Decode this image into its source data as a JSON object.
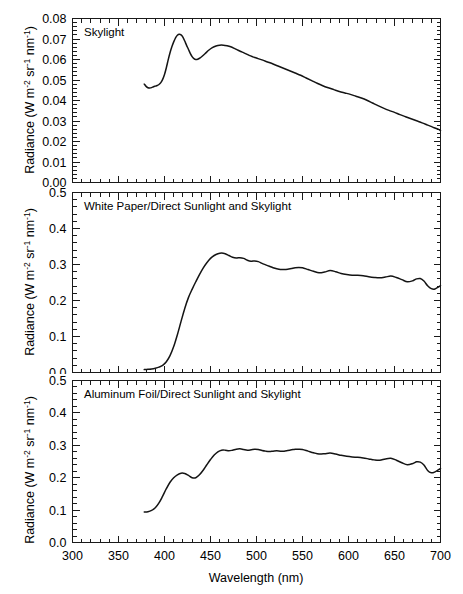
{
  "figure": {
    "background": "#ffffff",
    "line_color": "#141414",
    "axis_color": "#1a1a1a"
  },
  "axis": {
    "xlabel": "Wavelength (nm)",
    "ylabel_main": "Radiance (W m",
    "ylabel_sup1": "-2",
    "ylabel_mid1": " sr",
    "ylabel_sup2": "-1",
    "ylabel_mid2": " nm",
    "ylabel_sup3": "-1",
    "ylabel_end": ")",
    "xticklabels": [
      "300",
      "350",
      "400",
      "450",
      "500",
      "550",
      "600",
      "650",
      "700"
    ],
    "xtickvalues": [
      300,
      350,
      400,
      450,
      500,
      550,
      600,
      650,
      700
    ],
    "xminor_step": 10,
    "xlim": [
      300,
      700
    ]
  },
  "panels": [
    {
      "id": "skylight",
      "title": "Skylight",
      "yticklabels": [
        "0.00",
        "0.01",
        "0.02",
        "0.03",
        "0.04",
        "0.05",
        "0.06",
        "0.07",
        "0.08"
      ],
      "ytickvalues": [
        0.0,
        0.01,
        0.02,
        0.03,
        0.04,
        0.05,
        0.06,
        0.07,
        0.08
      ],
      "ylim": [
        0.0,
        0.08
      ],
      "yminor_count": 4
    },
    {
      "id": "white-paper",
      "title": "White Paper/Direct Sunlight and Skylight",
      "yticklabels": [
        "0.0",
        "0.1",
        "0.2",
        "0.3",
        "0.4",
        "0.5"
      ],
      "ytickvalues": [
        0.0,
        0.1,
        0.2,
        0.3,
        0.4,
        0.5
      ],
      "ylim": [
        0.0,
        0.5
      ],
      "yminor_count": 4
    },
    {
      "id": "aluminum-foil",
      "title": "Aluminum Foil/Direct Sunlight and Skylight",
      "yticklabels": [
        "0.0",
        "0.1",
        "0.2",
        "0.3",
        "0.4",
        "0.5"
      ],
      "ytickvalues": [
        0.0,
        0.1,
        0.2,
        0.3,
        0.4,
        0.5
      ],
      "ylim": [
        0.0,
        0.5
      ],
      "yminor_count": 4
    }
  ],
  "chart_data": [
    {
      "type": "line",
      "title": "Skylight",
      "xlabel": "Wavelength (nm)",
      "ylabel": "Radiance (W m-2 sr-1 nm-1)",
      "xlim": [
        300,
        700
      ],
      "ylim": [
        0.0,
        0.08
      ],
      "grid": false,
      "legend": "none",
      "series": [
        {
          "name": "Skylight",
          "x": [
            378,
            380,
            382,
            384,
            386,
            388,
            390,
            392,
            394,
            396,
            398,
            400,
            402,
            404,
            406,
            408,
            410,
            412,
            414,
            416,
            418,
            420,
            422,
            424,
            426,
            428,
            430,
            432,
            434,
            436,
            438,
            440,
            444,
            448,
            452,
            456,
            460,
            464,
            468,
            472,
            476,
            480,
            484,
            488,
            492,
            496,
            500,
            506,
            512,
            518,
            524,
            530,
            536,
            542,
            548,
            554,
            560,
            566,
            572,
            578,
            584,
            590,
            596,
            602,
            608,
            614,
            620,
            626,
            632,
            638,
            644,
            650,
            656,
            662,
            668,
            674,
            680,
            686,
            692,
            698,
            700
          ],
          "y": [
            0.048,
            0.0469,
            0.0462,
            0.0461,
            0.0463,
            0.0467,
            0.047,
            0.0473,
            0.0478,
            0.0487,
            0.0503,
            0.0527,
            0.056,
            0.0598,
            0.0633,
            0.0662,
            0.0686,
            0.0706,
            0.0718,
            0.0723,
            0.072,
            0.0709,
            0.069,
            0.0669,
            0.065,
            0.063,
            0.0614,
            0.0604,
            0.06,
            0.0601,
            0.0606,
            0.0612,
            0.0628,
            0.0645,
            0.0658,
            0.0666,
            0.067,
            0.067,
            0.0667,
            0.0662,
            0.0654,
            0.0645,
            0.0637,
            0.0629,
            0.062,
            0.0613,
            0.0607,
            0.0598,
            0.0588,
            0.0578,
            0.0567,
            0.0556,
            0.0545,
            0.0534,
            0.0523,
            0.051,
            0.0497,
            0.0484,
            0.0472,
            0.0462,
            0.0453,
            0.0444,
            0.0437,
            0.043,
            0.0421,
            0.0412,
            0.0401,
            0.0388,
            0.0375,
            0.0363,
            0.0352,
            0.0342,
            0.0331,
            0.0321,
            0.0311,
            0.0301,
            0.0291,
            0.028,
            0.0269,
            0.0259,
            0.0253
          ],
          "notes": "Rises from 0.048 at 378nm, dips to 0.046 near 383nm, peaks 0.072 at 416nm, local minimum 0.060 at 434nm, secondary peak 0.067 at 461nm, then monotonic decline to 0.017 at 700nm"
        }
      ]
    },
    {
      "type": "line",
      "title": "White Paper/Direct Sunlight and Skylight",
      "xlabel": "Wavelength (nm)",
      "ylabel": "Radiance (W m-2 sr-1 nm-1)",
      "xlim": [
        300,
        700
      ],
      "ylim": [
        0.0,
        0.5
      ],
      "grid": false,
      "legend": "none",
      "series": [
        {
          "name": "White Paper/Direct Sunlight and Skylight",
          "x": [
            378,
            382,
            386,
            390,
            394,
            398,
            402,
            406,
            410,
            414,
            418,
            422,
            426,
            430,
            434,
            438,
            442,
            446,
            450,
            454,
            458,
            462,
            466,
            470,
            474,
            478,
            482,
            486,
            490,
            494,
            498,
            502,
            506,
            510,
            514,
            518,
            522,
            526,
            530,
            534,
            538,
            542,
            546,
            550,
            556,
            562,
            568,
            574,
            580,
            586,
            592,
            598,
            604,
            610,
            616,
            622,
            628,
            634,
            640,
            646,
            652,
            658,
            664,
            670,
            674,
            678,
            682,
            686,
            690,
            694,
            698,
            700
          ],
          "y": [
            0.008,
            0.009,
            0.01,
            0.012,
            0.015,
            0.02,
            0.03,
            0.047,
            0.072,
            0.105,
            0.142,
            0.178,
            0.208,
            0.231,
            0.252,
            0.272,
            0.29,
            0.305,
            0.317,
            0.325,
            0.33,
            0.332,
            0.33,
            0.325,
            0.32,
            0.318,
            0.319,
            0.317,
            0.312,
            0.309,
            0.31,
            0.308,
            0.303,
            0.299,
            0.295,
            0.291,
            0.288,
            0.286,
            0.286,
            0.287,
            0.289,
            0.291,
            0.292,
            0.291,
            0.286,
            0.281,
            0.277,
            0.279,
            0.283,
            0.28,
            0.275,
            0.272,
            0.27,
            0.27,
            0.269,
            0.266,
            0.264,
            0.263,
            0.265,
            0.268,
            0.264,
            0.258,
            0.252,
            0.255,
            0.26,
            0.261,
            0.254,
            0.241,
            0.233,
            0.232,
            0.238,
            0.241
          ],
          "notes": "Near zero below 395nm, steep sigmoid rise from 400-455nm, plateau peak 0.33 at 462nm, slow decline with small oscillations, dip to 0.233 near 690nm, ends 0.241 at 700nm"
        }
      ]
    },
    {
      "type": "line",
      "title": "Aluminum Foil/Direct Sunlight and Skylight",
      "xlabel": "Wavelength (nm)",
      "ylabel": "Radiance (W m-2 sr-1 nm-1)",
      "xlim": [
        300,
        700
      ],
      "ylim": [
        0.0,
        0.5
      ],
      "grid": false,
      "legend": "none",
      "series": [
        {
          "name": "Aluminum Foil/Direct Sunlight and Skylight",
          "x": [
            378,
            382,
            386,
            390,
            394,
            398,
            402,
            406,
            410,
            414,
            418,
            422,
            426,
            430,
            434,
            438,
            442,
            446,
            450,
            454,
            458,
            462,
            466,
            470,
            474,
            478,
            482,
            486,
            490,
            494,
            498,
            502,
            506,
            510,
            514,
            518,
            522,
            526,
            530,
            534,
            538,
            542,
            546,
            550,
            556,
            562,
            568,
            574,
            580,
            586,
            592,
            598,
            604,
            610,
            616,
            622,
            628,
            634,
            640,
            646,
            652,
            658,
            664,
            670,
            674,
            678,
            682,
            686,
            690,
            694,
            698,
            700
          ],
          "y": [
            0.094,
            0.095,
            0.099,
            0.107,
            0.122,
            0.143,
            0.166,
            0.186,
            0.2,
            0.209,
            0.214,
            0.213,
            0.207,
            0.2,
            0.2,
            0.209,
            0.223,
            0.24,
            0.256,
            0.27,
            0.28,
            0.285,
            0.285,
            0.283,
            0.285,
            0.288,
            0.289,
            0.287,
            0.285,
            0.286,
            0.288,
            0.287,
            0.284,
            0.282,
            0.281,
            0.282,
            0.283,
            0.282,
            0.282,
            0.284,
            0.286,
            0.288,
            0.288,
            0.287,
            0.282,
            0.277,
            0.273,
            0.274,
            0.276,
            0.273,
            0.269,
            0.266,
            0.264,
            0.263,
            0.261,
            0.258,
            0.255,
            0.254,
            0.258,
            0.26,
            0.254,
            0.246,
            0.24,
            0.244,
            0.249,
            0.248,
            0.239,
            0.222,
            0.215,
            0.218,
            0.225,
            0.228
          ],
          "notes": "Starts 0.094 at 378nm, rises to local peak 0.214 at 418nm, dips to 0.200 at 432nm, rises to plateau ~0.285 from 460nm, gentle oscillating decline, sharp dip to 0.215 near 690nm, recovers to 0.228 at 700nm"
        }
      ]
    }
  ]
}
